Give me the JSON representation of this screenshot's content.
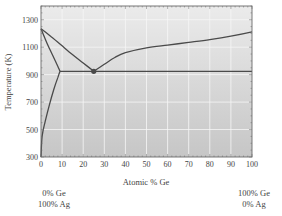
{
  "chart_data": {
    "type": "line",
    "title": "",
    "xlabel": "Atomic % Ge",
    "ylabel": "Temperature (K)",
    "xlim": [
      0,
      100
    ],
    "ylim": [
      300,
      1400
    ],
    "x_ticks": [
      "0",
      "10",
      "20",
      "30",
      "40",
      "50",
      "60",
      "70",
      "80",
      "90",
      "100"
    ],
    "y_ticks": [
      "300",
      "500",
      "700",
      "900",
      "1100",
      "1300"
    ],
    "grid": true,
    "legend": "none",
    "annotations": {
      "left_composition": [
        "0% Ge",
        "100% Ag"
      ],
      "right_composition": [
        "100% Ge",
        "0% Ag"
      ],
      "eutectic_point": {
        "x": 25,
        "y": 924,
        "label": ""
      }
    },
    "series": [
      {
        "name": "Ag-side liquidus",
        "x": [
          0,
          5,
          10,
          15,
          20,
          25
        ],
        "y": [
          1235,
          1175,
          1110,
          1045,
          985,
          924
        ]
      },
      {
        "name": "Ag-side solidus",
        "x": [
          0,
          2,
          4,
          6,
          8,
          9
        ],
        "y": [
          1235,
          1160,
          1090,
          1025,
          960,
          924
        ]
      },
      {
        "name": "Solvus",
        "x": [
          0,
          0.5,
          2,
          4,
          6,
          8,
          9
        ],
        "y": [
          300,
          450,
          560,
          680,
          790,
          880,
          924
        ]
      },
      {
        "name": "Ge-side liquidus",
        "x": [
          25,
          30,
          35,
          40,
          50,
          60,
          70,
          80,
          90,
          100
        ],
        "y": [
          924,
          975,
          1025,
          1060,
          1095,
          1115,
          1135,
          1155,
          1180,
          1211
        ]
      },
      {
        "name": "Eutectic isotherm",
        "x": [
          9,
          100
        ],
        "y": [
          924,
          924
        ]
      }
    ]
  },
  "colors": {
    "plot_bg_top": "#e9e9e9",
    "plot_bg_bottom": "#c9c9c9",
    "grid": "#f6f6f6",
    "curve": "#4a4a4a",
    "frame": "#6a6a6a"
  }
}
